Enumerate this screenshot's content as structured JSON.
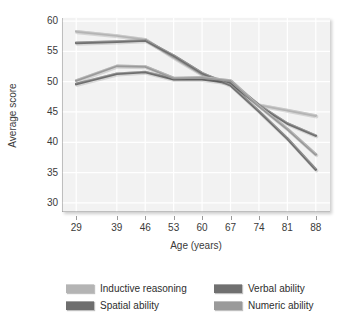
{
  "chart_data": {
    "type": "line",
    "title": "",
    "xlabel": "Age (years)",
    "ylabel": "Average score",
    "x": [
      29,
      39,
      46,
      53,
      60,
      67,
      74,
      81,
      88
    ],
    "categories": [
      "29",
      "39",
      "46",
      "53",
      "60",
      "67",
      "74",
      "81",
      "88"
    ],
    "xticks": [
      "29",
      "39",
      "46",
      "53",
      "60",
      "67",
      "74",
      "81",
      "88"
    ],
    "yticks": [
      "30",
      "35",
      "40",
      "45",
      "50",
      "55",
      "60"
    ],
    "ylim": [
      28.5,
      60.5
    ],
    "xlim": [
      25.5,
      91.5
    ],
    "grid": true,
    "legend_position": "bottom",
    "series": [
      {
        "name": "Inductive reasoning",
        "color": "#b4b4b4",
        "values": [
          58.3,
          57.6,
          57.0,
          54.0,
          51.2,
          49.8,
          46.2,
          45.3,
          44.4
        ]
      },
      {
        "name": "Spatial ability",
        "color": "#6e6e6e",
        "values": [
          49.6,
          51.3,
          51.6,
          50.4,
          50.4,
          49.8,
          46.1,
          43.1,
          41.1
        ]
      },
      {
        "name": "Verbal ability",
        "color": "#707070",
        "values": [
          56.4,
          56.6,
          56.8,
          54.3,
          51.4,
          49.4,
          45.1,
          40.6,
          35.5
        ]
      },
      {
        "name": "Numeric ability",
        "color": "#9a9a9a",
        "values": [
          50.2,
          52.6,
          52.5,
          50.6,
          50.7,
          50.2,
          46.0,
          42.2,
          38.0
        ]
      }
    ]
  },
  "legend": {
    "items": [
      {
        "label": "Inductive reasoning",
        "color": "#b4b4b4"
      },
      {
        "label": "Spatial ability",
        "color": "#6e6e6e"
      },
      {
        "label": "Verbal ability",
        "color": "#707070"
      },
      {
        "label": "Numeric ability",
        "color": "#9a9a9a"
      }
    ]
  },
  "axes": {
    "x_title": "Age (years)",
    "y_title": "Average score"
  },
  "colors": {
    "plot_background": "#f2f2f2",
    "gridline": "#ffffff",
    "axis_line": "#8a8a8a",
    "text": "#3a3a3a"
  }
}
